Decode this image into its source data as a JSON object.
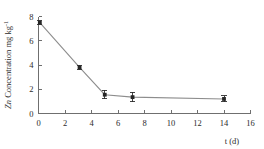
{
  "chart_data": {
    "type": "line",
    "title": "",
    "subtitle": "",
    "xlabel": "t (d)",
    "ylabel_italic": "Zn",
    "ylabel_rest": " Concentration mg kg",
    "ylabel_superscript": "-1",
    "ylabel_full": "Zn Concentration mg kg-1",
    "xlim": [
      0,
      16
    ],
    "ylim": [
      0,
      8
    ],
    "xticks": [
      0,
      2,
      4,
      6,
      8,
      10,
      12,
      14,
      16
    ],
    "xtick_labels": [
      "0",
      "2",
      "4",
      "6",
      "8",
      "10",
      "12",
      "14",
      "16"
    ],
    "yticks": [
      0,
      2,
      4,
      6,
      8
    ],
    "ytick_labels": [
      "0",
      "2",
      "4",
      "6",
      "8"
    ],
    "grid": false,
    "legend": false,
    "legend_position": "none",
    "marker": "square",
    "line_color": "#8d8d8d",
    "marker_color": "#262626",
    "axis_color": "#6f6f6f",
    "series": [
      {
        "name": "Zn Concentration",
        "x": [
          0.1,
          3.1,
          5.0,
          7.1,
          14.0
        ],
        "y": [
          7.5,
          3.8,
          1.55,
          1.35,
          1.2
        ],
        "yerr": [
          0.15,
          0.2,
          0.35,
          0.4,
          0.25
        ]
      }
    ]
  }
}
